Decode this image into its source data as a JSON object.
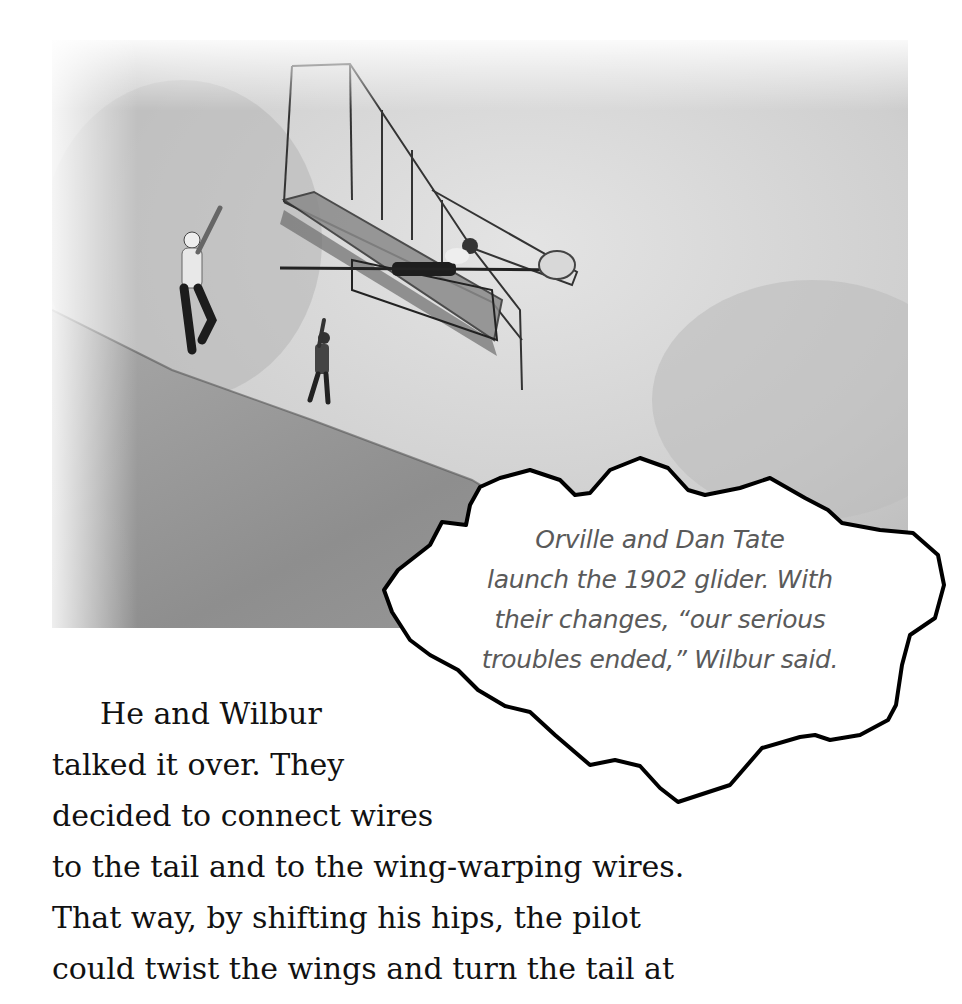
{
  "photo": {
    "subject": "1902 glider launch on sand dune",
    "alt": "Orville and Dan Tate launching the 1902 glider on a sand dune"
  },
  "caption": {
    "lines": [
      "Orville and Dan Tate",
      "launch the 1902 glider. With",
      "their changes, “our serious",
      "troubles ended,” Wilbur said."
    ]
  },
  "body": {
    "lines": [
      "He and Wilbur",
      "talked it over. They",
      "decided to connect wires",
      "to the tail and to the wing-warping wires.",
      "That way, by shifting his hips, the pilot",
      "could twist the wings and turn the tail at"
    ]
  },
  "colors": {
    "caption_text": "#5a5a5a",
    "body_text": "#111111",
    "cloud_outline": "#000000"
  }
}
